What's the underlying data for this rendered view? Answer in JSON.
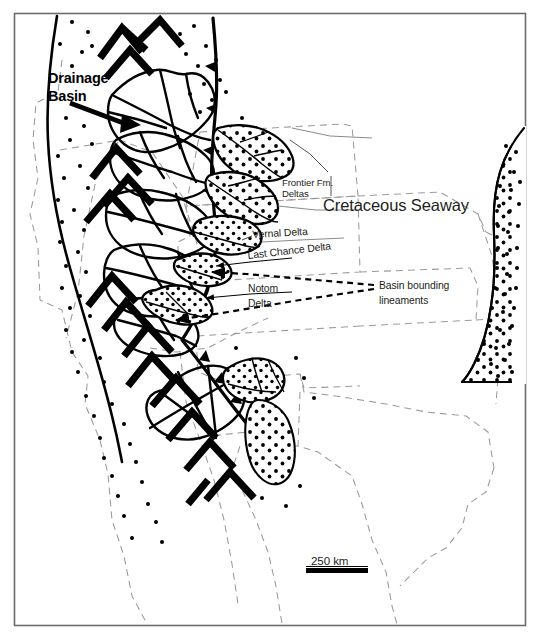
{
  "figure": {
    "frame_color": "#6b6b6b",
    "background_color": "#ffffff"
  },
  "labels": {
    "drainage_basin": "Drainage\nBasin",
    "drainage_basin_line1": "Drainage",
    "drainage_basin_line2": "Basin",
    "cretaceous_seaway": "Cretaceous Seaway",
    "frontier_fm_line1": "Frontier Fm.",
    "frontier_fm_line2": "Deltas",
    "vernal_delta": "Vernal Delta",
    "last_chance_delta": "Last Chance Delta",
    "notom_delta_line1": "Notom",
    "notom_delta_line2": "Delta",
    "basin_lineaments_line1": "Basin bounding",
    "basin_lineaments_line2": "lineaments"
  },
  "scale_bar": {
    "label": "250 km",
    "length_px": 62
  },
  "map_features": {
    "thrust_front": "barbed-thrust-fault-line",
    "mountain_ranges": "chevron-mountain-symbols",
    "drainage_basins": "drainage-basin-outlines",
    "delta_lobes": "stippled-delta-lobes",
    "shoreline_sand": "stippled-eastern-shoreline",
    "state_boundaries": "dashed-state-outlines",
    "basin_bounding_lineaments": "dashed-lineament-arrows",
    "alluvial_stipple": "scattered-dot-texture"
  },
  "colors": {
    "ink": "#000000",
    "text": "#231f20",
    "state_line": "#9a9a9a",
    "frame": "#6b6b6b"
  }
}
